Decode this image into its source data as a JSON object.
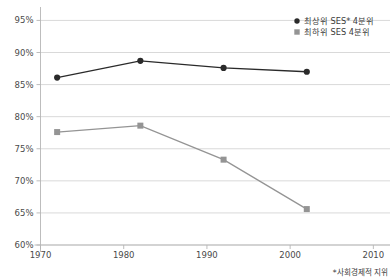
{
  "chart_data": {
    "type": "line",
    "title": "",
    "subtitle": "",
    "xlabel": "",
    "ylabel": "",
    "xlim": [
      1970,
      2012
    ],
    "ylim": [
      60,
      96
    ],
    "grid": true,
    "legend_position": "top-right",
    "x_ticks": [
      "1970",
      "1980",
      "1990",
      "2000",
      "2010"
    ],
    "x_tick_values": [
      1970,
      1980,
      1990,
      2000,
      2010
    ],
    "y_ticks": [
      "60%",
      "65%",
      "70%",
      "75%",
      "80%",
      "85%",
      "90%",
      "95%"
    ],
    "y_tick_values": [
      60,
      65,
      70,
      75,
      80,
      85,
      90,
      95
    ],
    "x": [
      1972,
      1982,
      1992,
      2002
    ],
    "series": [
      {
        "name": "최상위 SES* 4분위",
        "color": "#2a2a2a",
        "marker": "circle",
        "values": [
          86.1,
          88.7,
          87.6,
          87.0
        ]
      },
      {
        "name": "최하위 SES 4분위",
        "color": "#949494",
        "marker": "square",
        "values": [
          77.6,
          78.6,
          73.3,
          65.6
        ]
      }
    ],
    "annotations": [
      {
        "name": "footnote",
        "text": "*사회경제적 지위"
      }
    ]
  },
  "legend": {
    "items": [
      {
        "label": "최상위 SES* 4분위",
        "color": "#2a2a2a",
        "marker": "circle"
      },
      {
        "label": "최하위 SES 4분위",
        "color": "#949494",
        "marker": "square"
      }
    ]
  },
  "footnote": {
    "text": "*사회경제적 지위"
  },
  "colors": {
    "series_high": "#2a2a2a",
    "series_low": "#949494",
    "gridline": "#c9c9c9",
    "axis": "#b5b5b5",
    "text": "#3b3b3b",
    "background": "#ffffff"
  }
}
